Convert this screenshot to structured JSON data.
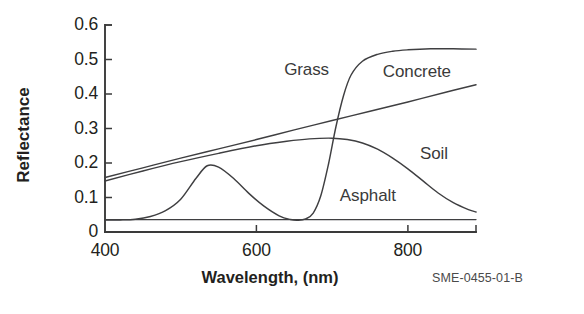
{
  "figure": {
    "code": "SME-0455-01-B",
    "background_color": "#ffffff",
    "line_color": "#3f3f41",
    "axis_color": "#3a3a3a",
    "text_color": "#231f20"
  },
  "chart_data": {
    "type": "line",
    "title": "",
    "subtitle": "",
    "xlabel": "Wavelength, (nm)",
    "ylabel": "Reflectance",
    "xlim": [
      400,
      890
    ],
    "ylim": [
      0,
      0.6
    ],
    "xticks": [
      400,
      600,
      800
    ],
    "xtick_labels": [
      "400",
      "600",
      "800"
    ],
    "yticks": [
      0,
      0.1,
      0.2,
      0.3,
      0.4,
      0.5,
      0.6
    ],
    "ytick_labels": [
      "0",
      "0.1",
      "0.2",
      "0.3",
      "0.4",
      "0.5",
      "0.6"
    ],
    "grid": false,
    "legend_position": "inline-annotations",
    "annotations": [
      {
        "text": "Grass",
        "x": 700,
        "y": 0.47
      },
      {
        "text": "Concrete",
        "x": 862,
        "y": 0.465
      },
      {
        "text": "Soil",
        "x": 845,
        "y": 0.225
      },
      {
        "text": "Asphalt",
        "x": 755,
        "y": 0.105
      }
    ],
    "series": [
      {
        "name": "Grass",
        "x": [
          400,
          420,
          440,
          460,
          480,
          500,
          520,
          535,
          550,
          570,
          590,
          610,
          630,
          645,
          655,
          665,
          675,
          685,
          695,
          705,
          715,
          725,
          740,
          760,
          780,
          800,
          830,
          860,
          890
        ],
        "values": [
          0.035,
          0.035,
          0.037,
          0.045,
          0.062,
          0.095,
          0.155,
          0.192,
          0.188,
          0.155,
          0.112,
          0.075,
          0.047,
          0.036,
          0.034,
          0.038,
          0.055,
          0.105,
          0.195,
          0.305,
          0.395,
          0.455,
          0.495,
          0.515,
          0.524,
          0.528,
          0.531,
          0.531,
          0.53
        ]
      },
      {
        "name": "Concrete",
        "x": [
          400,
          450,
          500,
          550,
          600,
          650,
          700,
          750,
          800,
          850,
          890
        ],
        "values": [
          0.158,
          0.186,
          0.214,
          0.241,
          0.268,
          0.296,
          0.323,
          0.35,
          0.377,
          0.405,
          0.427
        ]
      },
      {
        "name": "Soil",
        "x": [
          400,
          450,
          500,
          550,
          600,
          640,
          670,
          700,
          720,
          740,
          760,
          780,
          800,
          820,
          840,
          860,
          880,
          890
        ],
        "values": [
          0.148,
          0.177,
          0.204,
          0.228,
          0.25,
          0.263,
          0.27,
          0.272,
          0.268,
          0.258,
          0.24,
          0.214,
          0.183,
          0.148,
          0.113,
          0.085,
          0.065,
          0.058
        ]
      },
      {
        "name": "Asphalt",
        "x": [
          400,
          500,
          600,
          700,
          800,
          890
        ],
        "values": [
          0.036,
          0.036,
          0.036,
          0.036,
          0.036,
          0.036
        ]
      }
    ]
  }
}
